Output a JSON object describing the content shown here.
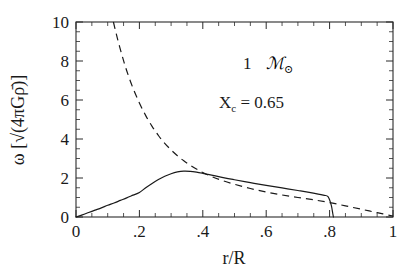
{
  "chart_data": {
    "type": "line",
    "title": "",
    "xlabel": "r/R",
    "ylabel": "ω [√(4πGρ̄)]",
    "xlim": [
      0,
      1
    ],
    "ylim": [
      0,
      10
    ],
    "grid": false,
    "legend": "none",
    "background_color": "#ffffff",
    "line_color": "#1a1a1a",
    "xticks": [
      0,
      0.2,
      0.4,
      0.6,
      0.8,
      1
    ],
    "xticklabels": [
      "0",
      ".2",
      ".4",
      ".6",
      ".8",
      "1"
    ],
    "yticks": [
      0,
      2,
      4,
      6,
      8,
      10
    ],
    "yticklabels": [
      "0",
      "2",
      "4",
      "6",
      "8",
      "10"
    ],
    "x_minor_tick_step": 0.05,
    "y_minor_tick_step": 0.5,
    "tick_direction": "in",
    "annotations": [
      {
        "text": "1",
        "script": "ℳ",
        "subscript": "⊙",
        "x": 0.52,
        "y": 7.9
      },
      {
        "text": "X",
        "subscript": "c",
        "rest": "=  0.65",
        "x": 0.45,
        "y": 6.1
      }
    ],
    "series": [
      {
        "name": "omega-solid",
        "style": "solid",
        "x": [
          0.0,
          0.02,
          0.04,
          0.06,
          0.08,
          0.1,
          0.12,
          0.14,
          0.16,
          0.18,
          0.2,
          0.22,
          0.24,
          0.26,
          0.28,
          0.3,
          0.32,
          0.34,
          0.36,
          0.38,
          0.4,
          0.42,
          0.45,
          0.48,
          0.5,
          0.55,
          0.6,
          0.65,
          0.7,
          0.74,
          0.78,
          0.795,
          0.805,
          0.81,
          0.812
        ],
        "y": [
          0.0,
          0.11,
          0.23,
          0.35,
          0.47,
          0.6,
          0.72,
          0.85,
          0.98,
          1.12,
          1.26,
          1.5,
          1.72,
          1.92,
          2.09,
          2.22,
          2.31,
          2.35,
          2.34,
          2.3,
          2.24,
          2.17,
          2.07,
          1.97,
          1.91,
          1.76,
          1.62,
          1.49,
          1.36,
          1.25,
          1.12,
          1.04,
          0.62,
          0.18,
          0.0
        ]
      },
      {
        "name": "omega-dashed",
        "style": "dashed",
        "x": [
          0.118,
          0.13,
          0.145,
          0.16,
          0.18,
          0.2,
          0.22,
          0.24,
          0.26,
          0.28,
          0.3,
          0.32,
          0.34,
          0.36,
          0.38,
          0.4,
          0.43,
          0.46,
          0.5,
          0.55,
          0.6,
          0.65,
          0.7,
          0.75,
          0.8,
          0.85,
          0.9,
          0.95,
          1.0
        ],
        "y": [
          10.0,
          9.2,
          8.3,
          7.5,
          6.6,
          5.85,
          5.2,
          4.65,
          4.18,
          3.78,
          3.44,
          3.14,
          2.88,
          2.66,
          2.46,
          2.28,
          2.06,
          1.88,
          1.68,
          1.46,
          1.28,
          1.13,
          1.0,
          0.88,
          0.74,
          0.57,
          0.4,
          0.22,
          0.05
        ]
      }
    ]
  },
  "figure": {
    "xlabel": "r/R",
    "omega_symbol": "ω",
    "unit_bracket_open": "[",
    "unit_bracket_close": "]",
    "sqrt_symbol": "√",
    "unit_inner": "(4πGρ̄)",
    "mass_value": "1",
    "mass_script": "ℳ",
    "mass_subscript": "⊙",
    "xc_symbol": "X",
    "xc_subscript": "c",
    "xc_equals": "=",
    "xc_value": "0.65"
  }
}
